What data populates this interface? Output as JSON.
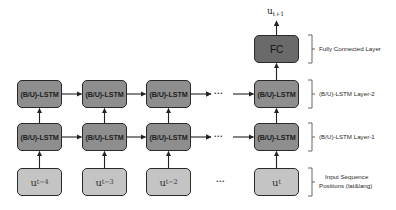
{
  "diagram": {
    "output_label": {
      "base": "u",
      "sub": "t+1"
    },
    "fc_label": "FC",
    "lstm_label": "(B/U)-LSTM",
    "ellipsis": "...",
    "inputs": [
      {
        "base": "u",
        "sub": "t−4"
      },
      {
        "base": "u",
        "sub": "t−3"
      },
      {
        "base": "u",
        "sub": "t−2"
      },
      {
        "base": "u",
        "sub": "t"
      }
    ],
    "layer_labels": {
      "fc": "Fully Connected Layer",
      "lstm2": "(B/U)-LSTM Layer-2",
      "lstm1": "(B/U)-LSTM Layer-1",
      "input_line1": "Input Sequence",
      "input_line2": "Positions (lat&lang)"
    },
    "colors": {
      "lstm_fill": "#8e8e8e",
      "fc_fill": "#6a6a6a",
      "input_fill": "#c4c4c4",
      "stroke": "#2a2a2a"
    }
  }
}
